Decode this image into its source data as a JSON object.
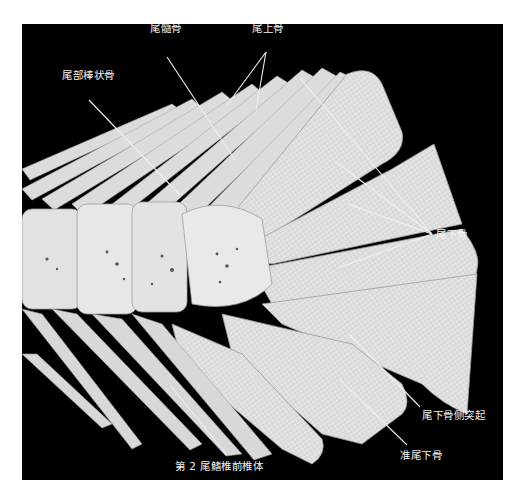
{
  "figure": {
    "background_color": "#000000",
    "bone_color": "#e6e6e6",
    "label_color": "#f2f2f2",
    "leader_line_color": "#f0f0f0",
    "labels": [
      {
        "id": "urostyle",
        "text": "尾髓骨"
      },
      {
        "id": "epural",
        "text": "尾上骨"
      },
      {
        "id": "uroneural_rod",
        "text": "尾部棒状骨"
      },
      {
        "id": "hypural",
        "text": "尾下骨"
      },
      {
        "id": "hypurapophysis",
        "text": "尾下骨侧突起"
      },
      {
        "id": "parhypural",
        "text": "准尾下骨"
      },
      {
        "id": "preural_centrum_2",
        "text": "第 2 尾鳍椎前椎体"
      }
    ]
  }
}
